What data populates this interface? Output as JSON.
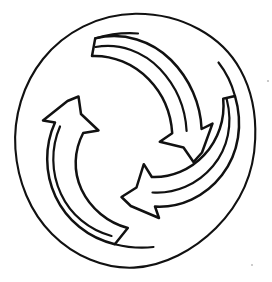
{
  "figure": {
    "title": "Three curved arrows in a circular cyclic arrangement",
    "background_color": "#ffffff",
    "stroke_color": "#111111",
    "style": "hand-drawn black line art, unfilled outlines",
    "canvas": {
      "width": 272,
      "height": 282
    },
    "outer_circle": {
      "label": "enclosing circle",
      "center_x": 135,
      "center_y": 141,
      "radius_x": 120,
      "radius_y": 127,
      "stroke_width": 2.1
    },
    "arrows": [
      {
        "id": "arrow-upper-right",
        "label": "upper right arrow",
        "direction": "points down toward center",
        "head_tip_x": 160,
        "head_tip_y": 142,
        "tail_start_x": 95,
        "tail_start_y": 38,
        "rotation_deg": 0,
        "sweep": "clockwise"
      },
      {
        "id": "arrow-lower-right",
        "label": "lower right arrow",
        "direction": "points left toward center",
        "head_tip_x": 129,
        "head_tip_y": 162,
        "tail_start_x": 235,
        "tail_start_y": 96,
        "rotation_deg": 120,
        "sweep": "clockwise"
      },
      {
        "id": "arrow-left",
        "label": "left arrow",
        "direction": "points up-right toward center",
        "head_tip_x": 150,
        "head_tip_y": 116,
        "tail_start_x": 115,
        "tail_start_y": 244,
        "rotation_deg": 240,
        "sweep": "clockwise"
      }
    ],
    "annotations": {
      "arrow_count": 3,
      "symmetry": "3-fold rotational",
      "line_weight_px": 2.4
    }
  }
}
